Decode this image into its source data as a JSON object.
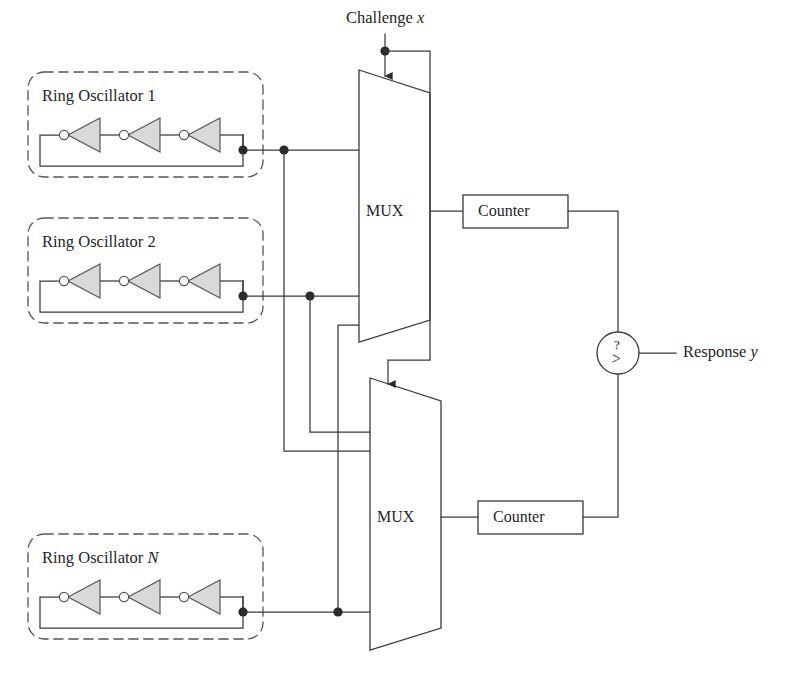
{
  "diagram": {
    "title_hidden": "Ring Oscillator PUF block diagram",
    "inputs": {
      "challenge_label": "Challenge",
      "challenge_var": "x"
    },
    "outputs": {
      "response_label": "Response",
      "response_var": "y"
    },
    "oscillators": [
      {
        "name_prefix": "Ring Oscillator",
        "index": "1",
        "inverter_count": 3
      },
      {
        "name_prefix": "Ring Oscillator",
        "index": "2",
        "inverter_count": 3
      },
      {
        "name_prefix": "Ring Oscillator",
        "index": "N",
        "inverter_count": 3
      }
    ],
    "muxes": [
      {
        "label": "MUX"
      },
      {
        "label": "MUX"
      }
    ],
    "counters": [
      {
        "label": "Counter"
      },
      {
        "label": "Counter"
      }
    ],
    "comparator": {
      "question_mark": "?",
      "operator": ">"
    },
    "colors": {
      "line": "#3a3a3a",
      "inverter_fill": "#d9d9d9",
      "inverter_stroke": "#555555",
      "dot": "#2b2b2b",
      "dashed_border": "#555555",
      "text": "#262626",
      "background": "#ffffff"
    }
  }
}
